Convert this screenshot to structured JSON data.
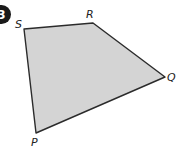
{
  "problem": {
    "number": "3"
  },
  "shape": {
    "type": "quadrilateral",
    "fill": "#d4d4d4",
    "stroke": "#2b2b2b",
    "vertices": [
      {
        "label": "S",
        "x": 24,
        "y": 29
      },
      {
        "label": "R",
        "x": 93,
        "y": 23
      },
      {
        "label": "Q",
        "x": 165,
        "y": 77
      },
      {
        "label": "P",
        "x": 36,
        "y": 133
      }
    ]
  },
  "labels": {
    "S": "S",
    "R": "R",
    "Q": "Q",
    "P": "P"
  }
}
